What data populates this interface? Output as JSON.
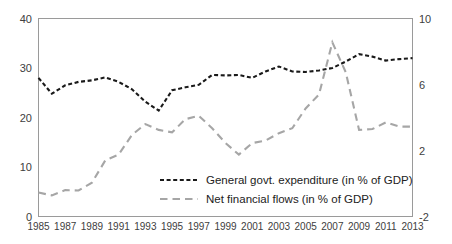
{
  "chart_data": {
    "type": "line",
    "title": "",
    "xlabel": "",
    "ylabel": "",
    "grid": false,
    "legend_position": "inside-bottom-center",
    "x": [
      1985,
      1986,
      1987,
      1988,
      1989,
      1990,
      1991,
      1992,
      1993,
      1994,
      1995,
      1996,
      1997,
      1998,
      1999,
      2000,
      2001,
      2002,
      2003,
      2004,
      2005,
      2006,
      2007,
      2008,
      2009,
      2010,
      2011,
      2012,
      2013
    ],
    "x_tick_labels": [
      "1985",
      "1987",
      "1989",
      "1991",
      "1993",
      "1995",
      "1997",
      "1999",
      "2001",
      "2003",
      "2005",
      "2007",
      "2009",
      "2011",
      "2013"
    ],
    "x_ticks": [
      1985,
      1987,
      1989,
      1991,
      1993,
      1995,
      1997,
      1999,
      2001,
      2003,
      2005,
      2007,
      2009,
      2011,
      2013
    ],
    "xlim": [
      1985,
      2013
    ],
    "left_axis": {
      "ticks": [
        0,
        10,
        20,
        30,
        40
      ],
      "tick_labels": [
        "0",
        "10",
        "20",
        "30",
        "40"
      ],
      "ylim": [
        0,
        40
      ]
    },
    "right_axis": {
      "ticks": [
        -2,
        2,
        6,
        10
      ],
      "tick_labels": [
        "-2",
        "2",
        "6",
        "10"
      ],
      "ylim": [
        -2,
        10
      ]
    },
    "series": [
      {
        "name": "General govt. expenditure (in % of GDP)",
        "axis": "left",
        "color": "#1a1a1a",
        "dash": "4,2.6",
        "width": 2.1,
        "values": [
          28.0,
          24.8,
          26.5,
          27.2,
          27.5,
          28.1,
          27.2,
          25.7,
          23.2,
          21.4,
          25.5,
          26.1,
          26.6,
          28.6,
          28.5,
          28.6,
          28.0,
          29.3,
          30.3,
          29.3,
          29.2,
          29.5,
          30.0,
          31.3,
          32.8,
          32.3,
          31.5,
          31.8,
          32.0
        ]
      },
      {
        "name": "Net financial flows (in % of GDP)",
        "axis": "right",
        "color": "#a6a6a6",
        "dash": "7.5,5",
        "width": 2.1,
        "values": [
          -0.55,
          -0.72,
          -0.4,
          -0.42,
          0.05,
          1.4,
          1.75,
          2.95,
          3.6,
          3.25,
          3.1,
          3.9,
          4.1,
          3.35,
          2.45,
          1.75,
          2.45,
          2.6,
          3.05,
          3.35,
          4.55,
          5.4,
          8.55,
          6.75,
          3.25,
          3.3,
          3.7,
          3.45,
          3.45
        ]
      }
    ]
  },
  "legend": {
    "entries": [
      {
        "label": "General govt. expenditure (in % of GDP)"
      },
      {
        "label": "Net financial flows (in % of GDP)"
      }
    ]
  },
  "colors": {
    "series_primary": "#1a1a1a",
    "series_secondary": "#a6a6a6",
    "frame": "#9a9a9a",
    "text": "#404040",
    "background": "#ffffff"
  }
}
